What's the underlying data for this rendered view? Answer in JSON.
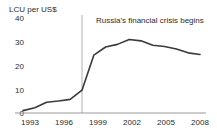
{
  "chart_data": {
    "type": "line",
    "title": "",
    "subtitle": "",
    "xlabel": "",
    "ylabel": "LCU per US$",
    "ylim": [
      0,
      40
    ],
    "xlim": [
      1993,
      2008
    ],
    "grid": false,
    "legend": "none",
    "y_ticks": [
      "0",
      "10",
      "20",
      "30",
      "40"
    ],
    "y_tick_values": [
      0,
      10,
      20,
      30,
      40
    ],
    "x_ticks": [
      "1993",
      "1996",
      "1999",
      "2002",
      "2005",
      "2008"
    ],
    "x_tick_values": [
      1993,
      1996,
      1999,
      2002,
      2005,
      2008
    ],
    "series": [
      {
        "name": "LCU per US$",
        "color": "#3a3a3a",
        "x": [
          1993,
          1994,
          1995,
          1996,
          1997,
          1998,
          1999,
          2000,
          2001,
          2002,
          2003,
          2004,
          2005,
          2006,
          2007,
          2008
        ],
        "values": [
          1.0,
          2.2,
          4.6,
          5.1,
          5.8,
          9.7,
          24.6,
          28.1,
          29.2,
          31.3,
          30.7,
          28.8,
          28.3,
          27.2,
          25.6,
          24.9
        ]
      }
    ],
    "annotations": [
      {
        "text": "Russia's financial crisis begins",
        "marker_type": "vertical-line",
        "marker_x": 1998,
        "marker_color": "#b0b0b0"
      }
    ],
    "axis_line_color": "#9a9a9a",
    "background_color": "#ffffff"
  }
}
